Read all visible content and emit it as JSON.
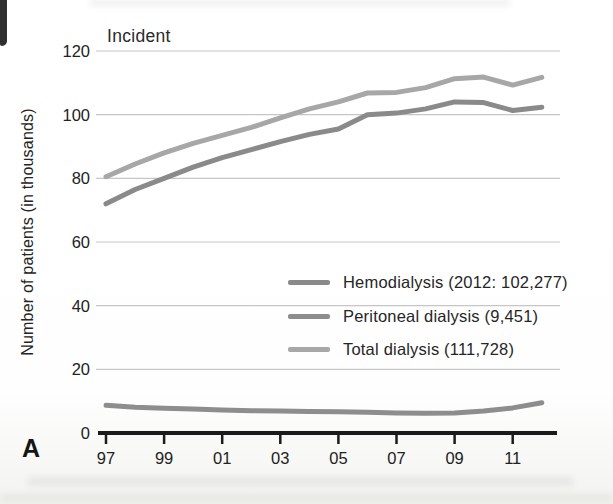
{
  "figure": {
    "panel_label": "A",
    "title": "Incident",
    "ylabel": "Number of patients (in thousands)"
  },
  "chart_data": {
    "type": "line",
    "title": "Incident",
    "xlabel": "",
    "ylabel": "Number of patients (in thousands)",
    "ylim": [
      0,
      120
    ],
    "y_ticks": [
      0,
      20,
      40,
      60,
      80,
      100,
      120
    ],
    "grid": "horizontal",
    "legend_position": "center-right",
    "x": [
      1997,
      1998,
      1999,
      2000,
      2001,
      2002,
      2003,
      2004,
      2005,
      2006,
      2007,
      2008,
      2009,
      2010,
      2011,
      2012
    ],
    "x_tick_years": [
      1997,
      1999,
      2001,
      2003,
      2005,
      2007,
      2009,
      2011
    ],
    "x_tick_labels": [
      "97",
      "99",
      "01",
      "03",
      "05",
      "07",
      "09",
      "11"
    ],
    "series": [
      {
        "key": "hemodialysis",
        "name": "Hemodialysis (2012: 102,277)",
        "color": "#8a8a8a",
        "values": [
          72,
          76.5,
          80,
          83.5,
          86.5,
          89,
          91.5,
          93.8,
          95.5,
          100,
          100.5,
          101.8,
          104,
          103.8,
          101.3,
          102.3
        ]
      },
      {
        "key": "peritoneal-dialysis",
        "name": "Peritoneal dialysis (9,451)",
        "color": "#8d8d8d",
        "values": [
          8.7,
          8.1,
          7.8,
          7.5,
          7.2,
          7.0,
          6.9,
          6.8,
          6.7,
          6.5,
          6.3,
          6.2,
          6.3,
          6.9,
          7.9,
          9.5
        ]
      },
      {
        "key": "total-dialysis",
        "name": "Total dialysis (111,728)",
        "color": "#a7a7a7",
        "values": [
          80.5,
          84.5,
          88,
          91,
          93.5,
          96,
          99,
          101.8,
          104,
          106.8,
          107,
          108.5,
          111.3,
          111.8,
          109.3,
          111.7
        ]
      }
    ]
  }
}
